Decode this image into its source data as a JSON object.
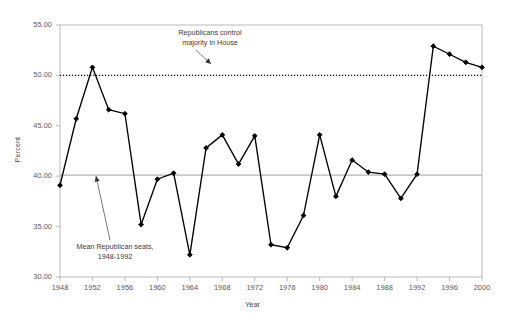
{
  "chart_data": {
    "type": "line",
    "title": "",
    "subtitle": "",
    "xlabel": "Year",
    "ylabel": "Percent",
    "xlim": [
      1948,
      2000
    ],
    "ylim": [
      30.0,
      55.0
    ],
    "grid": false,
    "legend": "none",
    "x": [
      1948,
      1950,
      1952,
      1954,
      1956,
      1958,
      1960,
      1962,
      1964,
      1966,
      1968,
      1970,
      1972,
      1974,
      1976,
      1978,
      1980,
      1982,
      1984,
      1986,
      1988,
      1990,
      1992,
      1994,
      1996,
      1998,
      2000
    ],
    "series": [
      {
        "name": "Republican seats in House",
        "values": [
          39.1,
          45.7,
          50.8,
          46.6,
          46.2,
          35.2,
          39.7,
          40.3,
          32.2,
          42.8,
          44.1,
          41.2,
          44.0,
          33.2,
          32.9,
          36.1,
          44.1,
          38.0,
          41.6,
          40.4,
          40.2,
          37.8,
          40.2,
          52.9,
          52.1,
          51.3,
          50.8
        ]
      }
    ],
    "reference_lines": [
      {
        "name": "majority-line",
        "label": "Republicans control majority in House",
        "value": 50.0,
        "style": "dotted"
      },
      {
        "name": "mean-line",
        "label": "Mean Republican seats, 1948-1992",
        "value": 40.1,
        "style": "solid"
      }
    ],
    "annotations": [
      {
        "name": "majority-annotation",
        "line1": "Republicans control",
        "line2": "majority in House"
      },
      {
        "name": "mean-annotation",
        "line1": "Mean Republican seats,",
        "line2": "1948-1992"
      }
    ],
    "ytick_labels": [
      "55.00",
      "50.00",
      "45.00",
      "40.00",
      "35.00",
      "30.00"
    ],
    "ytick_values": [
      55,
      50,
      45,
      40,
      35,
      30
    ],
    "xtick_labels": [
      "1948",
      "1952",
      "1956",
      "1960",
      "1964",
      "1968",
      "1972",
      "1976",
      "1980",
      "1984",
      "1988",
      "1992",
      "1996",
      "2000"
    ],
    "xtick_values": [
      1948,
      1952,
      1956,
      1960,
      1964,
      1968,
      1972,
      1976,
      1980,
      1984,
      1988,
      1992,
      1996,
      2000
    ],
    "colors": {
      "line": "#000000",
      "marker": "#000000",
      "mean_line": "#b3b3b3",
      "majority_line": "#000000",
      "axis": "#a9a9a9",
      "text": "#4a4a4a",
      "background": "#ffffff"
    }
  }
}
